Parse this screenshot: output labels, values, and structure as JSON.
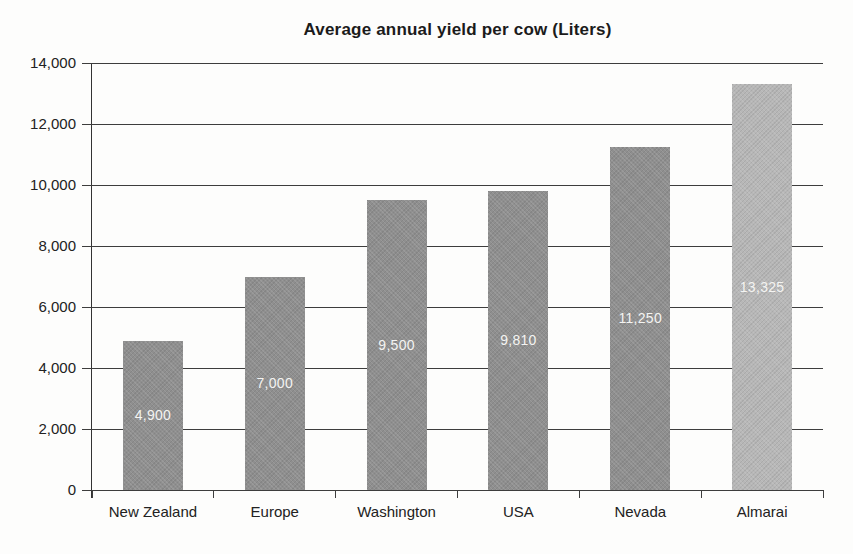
{
  "chart_data": {
    "type": "bar",
    "title": "Average annual yield per cow (Liters)",
    "categories": [
      "New Zealand",
      "Europe",
      "Washington",
      "USA",
      "Nevada",
      "Almarai"
    ],
    "values": [
      4900,
      7000,
      9500,
      9810,
      11250,
      13325
    ],
    "value_labels": [
      "4,900",
      "7,000",
      "9,500",
      "9,810",
      "11,250",
      "13,325"
    ],
    "xlabel": "",
    "ylabel": "",
    "ylim": [
      0,
      14000
    ],
    "ytick_interval": 2000,
    "ytick_labels": [
      "0",
      "2,000",
      "4,000",
      "6,000",
      "8,000",
      "10,000",
      "12,000",
      "14,000"
    ],
    "grid": "horizontal",
    "legend": "none",
    "bar_color_default": "#8f8f8f",
    "bar_color_highlight": "#b7b7b7",
    "highlight_index": 5,
    "value_label_color": "#f4f4f2",
    "gridline_color": "#3d3d3d"
  }
}
